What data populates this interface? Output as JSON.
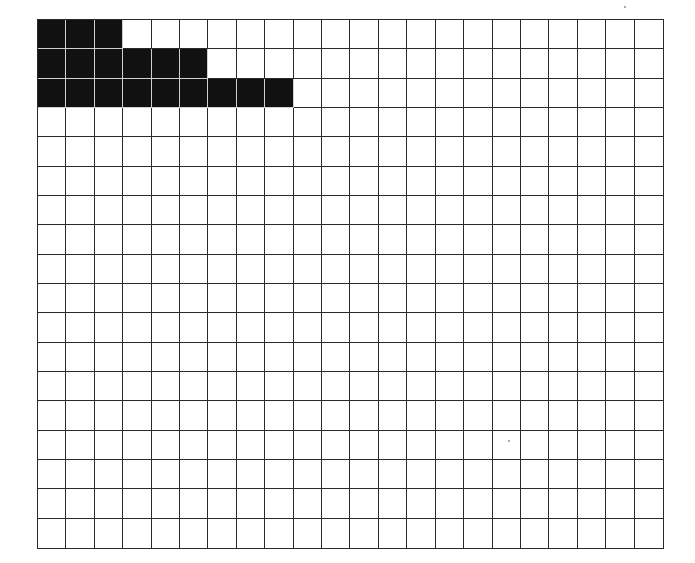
{
  "grid": {
    "columns": 22,
    "rows": 18,
    "fill_color": "#111111",
    "line_color": "#2a2a2a",
    "background_color": "#ffffff",
    "filled_counts_per_row": [
      3,
      6,
      9
    ],
    "filled_cells": [
      {
        "row": 0,
        "cols": [
          0,
          1,
          2
        ]
      },
      {
        "row": 1,
        "cols": [
          0,
          1,
          2,
          3,
          4,
          5
        ]
      },
      {
        "row": 2,
        "cols": [
          0,
          1,
          2,
          3,
          4,
          5,
          6,
          7,
          8
        ]
      }
    ]
  }
}
